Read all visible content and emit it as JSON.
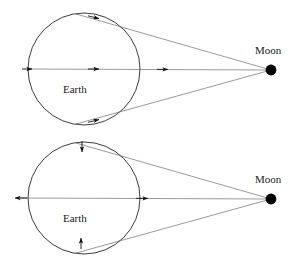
{
  "figure": {
    "name": "tidal-force-diagram",
    "background_color": "#ffffff",
    "width": 301,
    "height": 258,
    "panels": [
      {
        "id": "top",
        "caption": "Gravitational pull of the Moon on the Earth",
        "earth_label": "Earth",
        "moon_label": "Moon",
        "arrow_mode": "all-arrows-point-toward-moon"
      },
      {
        "id": "bottom",
        "caption": "Differential (tidal) force on the Earth",
        "earth_label": "Earth",
        "moon_label": "Moon",
        "arrow_mode": "stretching-along-earth-moon-axis"
      }
    ]
  },
  "labels": {
    "earth": "Earth",
    "moon": "Moon"
  },
  "colors": {
    "ink": "#1a1a1a",
    "ray": "#55555b",
    "arrow": "#111111",
    "moon_fill": "#000000",
    "background": "#ffffff"
  },
  "geometry": {
    "top": {
      "earth_center_x": 84,
      "earth_center_y": 69,
      "earth_radius": 56,
      "moon_x": 271,
      "moon_y": 70,
      "moon_radius": 5.4,
      "axis_y": 69
    },
    "bottom": {
      "earth_center_x": 84,
      "earth_center_y": 69,
      "earth_radius": 56,
      "moon_x": 271,
      "moon_y": 70,
      "moon_radius": 5.4,
      "axis_y": 69
    }
  },
  "icons": {
    "moon_body": "filled-circle-icon",
    "earth_body": "circle-outline-icon",
    "arrowhead": "arrowhead-icon"
  }
}
